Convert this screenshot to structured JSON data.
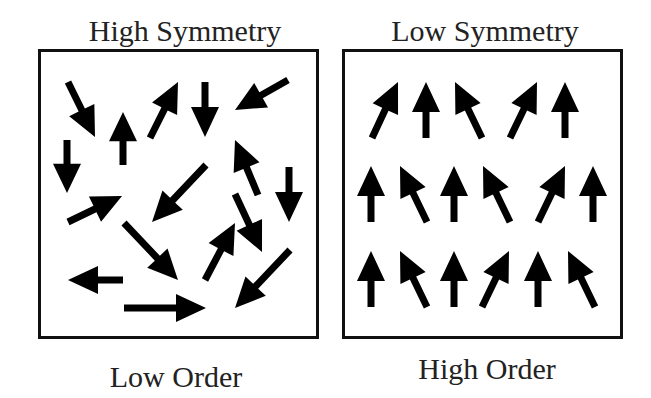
{
  "panels": [
    {
      "id": "left",
      "top_label": "High Symmetry",
      "bottom_label": "Low Order",
      "arrows": [
        {
          "tail": [
            68,
            82
          ],
          "tip": [
            95,
            137
          ]
        },
        {
          "tail": [
            123,
            165
          ],
          "tip": [
            123,
            112
          ]
        },
        {
          "tail": [
            150,
            138
          ],
          "tip": [
            178,
            82
          ]
        },
        {
          "tail": [
            205,
            82
          ],
          "tip": [
            205,
            137
          ]
        },
        {
          "tail": [
            288,
            80
          ],
          "tip": [
            235,
            110
          ]
        },
        {
          "tail": [
            67,
            140
          ],
          "tip": [
            67,
            193
          ]
        },
        {
          "tail": [
            258,
            195
          ],
          "tip": [
            235,
            140
          ]
        },
        {
          "tail": [
            289,
            167
          ],
          "tip": [
            289,
            222
          ]
        },
        {
          "tail": [
            68,
            222
          ],
          "tip": [
            122,
            196
          ]
        },
        {
          "tail": [
            206,
            165
          ],
          "tip": [
            152,
            222
          ]
        },
        {
          "tail": [
            124,
            223
          ],
          "tip": [
            178,
            280
          ]
        },
        {
          "tail": [
            235,
            194
          ],
          "tip": [
            262,
            252
          ]
        },
        {
          "tail": [
            205,
            280
          ],
          "tip": [
            235,
            223
          ]
        },
        {
          "tail": [
            290,
            250
          ],
          "tip": [
            235,
            308
          ]
        },
        {
          "tail": [
            123,
            280
          ],
          "tip": [
            68,
            280
          ]
        },
        {
          "tail": [
            124,
            308
          ],
          "tip": [
            206,
            308
          ]
        }
      ]
    },
    {
      "id": "right",
      "top_label": "Low Symmetry",
      "bottom_label": "High Order",
      "arrows": [
        {
          "tail": [
            372,
            138
          ],
          "tip": [
            398,
            82
          ]
        },
        {
          "tail": [
            426,
            138
          ],
          "tip": [
            426,
            82
          ]
        },
        {
          "tail": [
            482,
            138
          ],
          "tip": [
            455,
            82
          ]
        },
        {
          "tail": [
            510,
            138
          ],
          "tip": [
            537,
            82
          ]
        },
        {
          "tail": [
            565,
            138
          ],
          "tip": [
            565,
            82
          ]
        },
        {
          "tail": [
            371,
            222
          ],
          "tip": [
            371,
            166
          ]
        },
        {
          "tail": [
            427,
            222
          ],
          "tip": [
            400,
            166
          ]
        },
        {
          "tail": [
            454,
            222
          ],
          "tip": [
            454,
            166
          ]
        },
        {
          "tail": [
            510,
            222
          ],
          "tip": [
            483,
            166
          ]
        },
        {
          "tail": [
            538,
            222
          ],
          "tip": [
            565,
            166
          ]
        },
        {
          "tail": [
            593,
            222
          ],
          "tip": [
            593,
            166
          ]
        },
        {
          "tail": [
            371,
            307
          ],
          "tip": [
            371,
            251
          ]
        },
        {
          "tail": [
            427,
            307
          ],
          "tip": [
            400,
            251
          ]
        },
        {
          "tail": [
            454,
            307
          ],
          "tip": [
            454,
            251
          ]
        },
        {
          "tail": [
            482,
            307
          ],
          "tip": [
            509,
            251
          ]
        },
        {
          "tail": [
            538,
            307
          ],
          "tip": [
            538,
            251
          ]
        },
        {
          "tail": [
            595,
            307
          ],
          "tip": [
            568,
            251
          ]
        }
      ]
    }
  ],
  "colors": {
    "arrow": "#000000",
    "border": "#111111",
    "text": "#222222"
  }
}
